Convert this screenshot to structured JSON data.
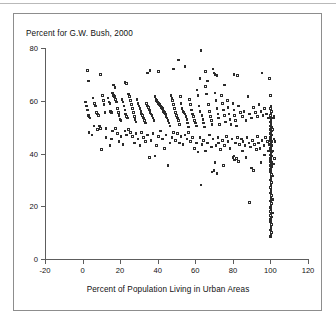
{
  "figure": {
    "title": "Percent for G.W. Bush, 2000",
    "xlabel": "Percent of Population Living in Urban Areas",
    "frame_color": "#8d8d8d",
    "axis_color": "#5d5d5d",
    "marker_color": "#2b2b2b",
    "background": "#ffffff"
  },
  "chart_data": {
    "type": "scatter",
    "title": "Percent for G.W. Bush, 2000",
    "xlabel": "Percent of Population Living in Urban Areas",
    "ylabel": "Percent for G.W. Bush, 2000",
    "xlim": [
      -20,
      120
    ],
    "ylim": [
      0,
      80
    ],
    "xticks": [
      -20,
      0,
      20,
      40,
      60,
      80,
      100,
      120
    ],
    "yticks": [
      0,
      20,
      40,
      60,
      80
    ],
    "grid": false,
    "legend": null,
    "marker": "open-square",
    "points": [
      [
        2.5,
        71.5
      ],
      [
        3.2,
        67.5
      ],
      [
        9.5,
        70.0
      ],
      [
        16.5,
        66.0
      ],
      [
        17.2,
        65.0
      ],
      [
        22.5,
        67.0
      ],
      [
        23.5,
        66.5
      ],
      [
        34.5,
        70.5
      ],
      [
        36.0,
        71.5
      ],
      [
        40.5,
        71.0
      ],
      [
        48.5,
        72.0
      ],
      [
        51.0,
        75.5
      ],
      [
        54.5,
        73.0
      ],
      [
        63.0,
        79.0
      ],
      [
        62.5,
        68.5
      ],
      [
        65.5,
        71.0
      ],
      [
        66.5,
        67.5
      ],
      [
        69.5,
        72.0
      ],
      [
        70.0,
        70.5
      ],
      [
        70.5,
        70.0
      ],
      [
        71.5,
        69.5
      ],
      [
        75.5,
        66.0
      ],
      [
        80.5,
        70.0
      ],
      [
        82.5,
        69.5
      ],
      [
        95.5,
        70.5
      ],
      [
        99.5,
        68.5
      ],
      [
        1.5,
        59.5
      ],
      [
        2.0,
        58.0
      ],
      [
        2.5,
        56.5
      ],
      [
        3.0,
        54.5
      ],
      [
        3.5,
        54.0
      ],
      [
        4.0,
        53.5
      ],
      [
        5.5,
        61.0
      ],
      [
        6.5,
        59.0
      ],
      [
        7.0,
        58.0
      ],
      [
        7.5,
        55.5
      ],
      [
        8.0,
        55.0
      ],
      [
        8.5,
        54.5
      ],
      [
        9.0,
        50.5
      ],
      [
        9.5,
        49.5
      ],
      [
        10.5,
        62.0
      ],
      [
        11.0,
        60.0
      ],
      [
        11.5,
        58.5
      ],
      [
        12.0,
        55.5
      ],
      [
        12.5,
        49.5
      ],
      [
        13.5,
        61.0
      ],
      [
        14.0,
        59.5
      ],
      [
        14.5,
        59.0
      ],
      [
        15.0,
        56.0
      ],
      [
        15.5,
        55.5
      ],
      [
        16.0,
        63.0
      ],
      [
        16.5,
        62.0
      ],
      [
        17.0,
        61.5
      ],
      [
        17.5,
        60.5
      ],
      [
        18.0,
        59.5
      ],
      [
        18.5,
        57.0
      ],
      [
        19.0,
        55.5
      ],
      [
        19.5,
        54.5
      ],
      [
        20.0,
        53.0
      ],
      [
        20.5,
        52.5
      ],
      [
        21.0,
        60.5
      ],
      [
        21.5,
        59.5
      ],
      [
        22.0,
        58.0
      ],
      [
        22.5,
        56.5
      ],
      [
        23.0,
        55.0
      ],
      [
        23.5,
        54.0
      ],
      [
        24.0,
        53.5
      ],
      [
        24.5,
        62.5
      ],
      [
        25.0,
        61.5
      ],
      [
        25.5,
        60.0
      ],
      [
        26.0,
        58.5
      ],
      [
        26.5,
        57.0
      ],
      [
        27.0,
        55.5
      ],
      [
        27.5,
        54.0
      ],
      [
        28.0,
        53.0
      ],
      [
        28.5,
        52.0
      ],
      [
        29.0,
        60.5
      ],
      [
        29.5,
        59.0
      ],
      [
        30.0,
        58.0
      ],
      [
        30.5,
        57.0
      ],
      [
        31.0,
        56.0
      ],
      [
        31.5,
        55.0
      ],
      [
        32.0,
        54.5
      ],
      [
        32.5,
        53.5
      ],
      [
        33.0,
        52.5
      ],
      [
        33.5,
        51.5
      ],
      [
        34.0,
        59.0
      ],
      [
        34.5,
        58.0
      ],
      [
        35.0,
        57.5
      ],
      [
        35.5,
        56.5
      ],
      [
        36.0,
        55.5
      ],
      [
        36.5,
        55.0
      ],
      [
        37.0,
        54.5
      ],
      [
        37.5,
        53.5
      ],
      [
        38.0,
        52.5
      ],
      [
        38.5,
        61.5
      ],
      [
        39.0,
        60.5
      ],
      [
        39.5,
        60.0
      ],
      [
        40.0,
        59.5
      ],
      [
        40.5,
        59.0
      ],
      [
        41.0,
        58.5
      ],
      [
        41.5,
        58.0
      ],
      [
        42.0,
        57.5
      ],
      [
        42.5,
        57.0
      ],
      [
        43.0,
        56.0
      ],
      [
        43.5,
        55.5
      ],
      [
        44.0,
        55.0
      ],
      [
        44.5,
        54.0
      ],
      [
        45.0,
        53.5
      ],
      [
        45.5,
        52.5
      ],
      [
        46.0,
        51.5
      ],
      [
        46.5,
        50.5
      ],
      [
        47.0,
        62.0
      ],
      [
        47.5,
        61.0
      ],
      [
        48.0,
        60.0
      ],
      [
        48.5,
        58.5
      ],
      [
        49.0,
        57.0
      ],
      [
        49.5,
        55.5
      ],
      [
        50.0,
        54.5
      ],
      [
        50.5,
        53.5
      ],
      [
        51.0,
        52.5
      ],
      [
        51.5,
        51.0
      ],
      [
        52.0,
        61.5
      ],
      [
        52.5,
        59.0
      ],
      [
        53.0,
        57.0
      ],
      [
        53.5,
        56.0
      ],
      [
        54.0,
        55.5
      ],
      [
        54.5,
        55.0
      ],
      [
        55.0,
        54.0
      ],
      [
        55.5,
        53.0
      ],
      [
        56.0,
        51.5
      ],
      [
        56.5,
        50.0
      ],
      [
        57.0,
        60.5
      ],
      [
        57.5,
        58.5
      ],
      [
        58.0,
        56.5
      ],
      [
        58.5,
        55.0
      ],
      [
        59.0,
        54.0
      ],
      [
        59.5,
        52.5
      ],
      [
        60.0,
        51.5
      ],
      [
        60.5,
        50.5
      ],
      [
        61.0,
        64.0
      ],
      [
        61.5,
        62.0
      ],
      [
        62.0,
        58.0
      ],
      [
        62.5,
        56.0
      ],
      [
        63.5,
        54.5
      ],
      [
        64.0,
        53.0
      ],
      [
        64.5,
        51.5
      ],
      [
        65.0,
        50.0
      ],
      [
        65.5,
        65.5
      ],
      [
        66.0,
        62.5
      ],
      [
        67.0,
        58.5
      ],
      [
        67.5,
        56.0
      ],
      [
        68.0,
        54.0
      ],
      [
        68.5,
        52.5
      ],
      [
        69.0,
        51.0
      ],
      [
        70.5,
        63.0
      ],
      [
        71.0,
        60.0
      ],
      [
        71.5,
        57.0
      ],
      [
        72.0,
        55.0
      ],
      [
        72.5,
        53.5
      ],
      [
        73.0,
        51.0
      ],
      [
        74.0,
        62.0
      ],
      [
        74.5,
        59.0
      ],
      [
        75.0,
        56.5
      ],
      [
        75.5,
        54.5
      ],
      [
        76.0,
        52.0
      ],
      [
        77.0,
        60.0
      ],
      [
        77.5,
        57.5
      ],
      [
        78.0,
        55.0
      ],
      [
        78.5,
        53.0
      ],
      [
        79.0,
        51.0
      ],
      [
        80.0,
        59.0
      ],
      [
        80.5,
        56.5
      ],
      [
        81.0,
        54.5
      ],
      [
        81.5,
        52.5
      ],
      [
        82.0,
        50.5
      ],
      [
        83.0,
        58.0
      ],
      [
        84.0,
        55.5
      ],
      [
        85.0,
        54.0
      ],
      [
        86.0,
        56.0
      ],
      [
        87.0,
        52.5
      ],
      [
        88.0,
        61.5
      ],
      [
        89.0,
        55.0
      ],
      [
        90.0,
        53.5
      ],
      [
        91.0,
        57.5
      ],
      [
        92.0,
        55.5
      ],
      [
        93.0,
        54.0
      ],
      [
        94.0,
        58.5
      ],
      [
        95.0,
        56.0
      ],
      [
        96.0,
        54.5
      ],
      [
        97.0,
        57.0
      ],
      [
        98.0,
        55.0
      ],
      [
        99.0,
        53.5
      ],
      [
        3.5,
        48.0
      ],
      [
        5.0,
        47.0
      ],
      [
        6.0,
        50.5
      ],
      [
        8.0,
        49.0
      ],
      [
        10.0,
        41.5
      ],
      [
        12.5,
        46.0
      ],
      [
        14.5,
        43.0
      ],
      [
        15.5,
        45.5
      ],
      [
        16.0,
        48.5
      ],
      [
        17.5,
        49.5
      ],
      [
        18.5,
        47.5
      ],
      [
        19.5,
        44.5
      ],
      [
        20.5,
        46.5
      ],
      [
        21.5,
        43.5
      ],
      [
        22.5,
        48.5
      ],
      [
        23.5,
        47.0
      ],
      [
        24.5,
        49.0
      ],
      [
        25.5,
        48.0
      ],
      [
        26.5,
        46.5
      ],
      [
        27.5,
        44.0
      ],
      [
        28.5,
        47.5
      ],
      [
        29.5,
        45.5
      ],
      [
        30.5,
        43.0
      ],
      [
        31.5,
        48.0
      ],
      [
        32.5,
        46.0
      ],
      [
        33.5,
        44.5
      ],
      [
        34.5,
        47.0
      ],
      [
        35.5,
        38.5
      ],
      [
        36.5,
        45.0
      ],
      [
        37.5,
        47.5
      ],
      [
        38.5,
        39.0
      ],
      [
        39.5,
        43.0
      ],
      [
        40.5,
        46.5
      ],
      [
        41.5,
        48.5
      ],
      [
        42.5,
        45.5
      ],
      [
        43.5,
        42.0
      ],
      [
        44.5,
        47.0
      ],
      [
        45.5,
        35.5
      ],
      [
        46.5,
        44.0
      ],
      [
        47.5,
        46.0
      ],
      [
        48.5,
        48.0
      ],
      [
        49.5,
        45.0
      ],
      [
        50.5,
        47.5
      ],
      [
        51.5,
        44.0
      ],
      [
        52.5,
        46.5
      ],
      [
        53.5,
        43.5
      ],
      [
        54.5,
        47.0
      ],
      [
        55.5,
        45.5
      ],
      [
        56.5,
        48.0
      ],
      [
        57.5,
        44.5
      ],
      [
        58.5,
        46.0
      ],
      [
        59.5,
        42.0
      ],
      [
        60.5,
        44.0
      ],
      [
        61.5,
        40.5
      ],
      [
        62.5,
        46.0
      ],
      [
        63.0,
        28.0
      ],
      [
        63.5,
        43.5
      ],
      [
        64.5,
        45.0
      ],
      [
        65.5,
        41.0
      ],
      [
        66.5,
        44.0
      ],
      [
        67.5,
        47.0
      ],
      [
        68.5,
        42.5
      ],
      [
        69.0,
        33.0
      ],
      [
        69.5,
        45.5
      ],
      [
        70.0,
        33.5
      ],
      [
        70.5,
        36.5
      ],
      [
        71.0,
        43.0
      ],
      [
        71.5,
        32.5
      ],
      [
        72.0,
        46.0
      ],
      [
        72.5,
        44.0
      ],
      [
        73.5,
        41.5
      ],
      [
        74.5,
        45.0
      ],
      [
        75.0,
        35.5
      ],
      [
        75.5,
        43.0
      ],
      [
        76.5,
        46.5
      ],
      [
        77.5,
        44.5
      ],
      [
        78.5,
        42.0
      ],
      [
        79.5,
        45.5
      ],
      [
        80.0,
        38.5
      ],
      [
        80.5,
        39.0
      ],
      [
        81.0,
        37.5
      ],
      [
        81.5,
        44.0
      ],
      [
        82.0,
        38.0
      ],
      [
        82.5,
        46.0
      ],
      [
        83.0,
        37.0
      ],
      [
        83.5,
        43.5
      ],
      [
        84.5,
        45.5
      ],
      [
        85.0,
        41.0
      ],
      [
        85.5,
        44.5
      ],
      [
        86.5,
        43.0
      ],
      [
        87.0,
        38.5
      ],
      [
        87.5,
        46.0
      ],
      [
        88.5,
        44.0
      ],
      [
        89.0,
        21.5
      ],
      [
        89.5,
        42.5
      ],
      [
        90.0,
        34.5
      ],
      [
        90.5,
        45.0
      ],
      [
        91.0,
        33.5
      ],
      [
        91.5,
        43.5
      ],
      [
        92.5,
        41.5
      ],
      [
        93.0,
        46.5
      ],
      [
        93.5,
        44.0
      ],
      [
        94.5,
        42.0
      ],
      [
        95.0,
        36.5
      ],
      [
        95.5,
        45.0
      ],
      [
        96.5,
        43.0
      ],
      [
        97.0,
        39.5
      ],
      [
        97.5,
        46.0
      ],
      [
        98.5,
        44.5
      ],
      [
        99.0,
        41.0
      ],
      [
        99.5,
        43.5
      ],
      [
        100.0,
        62.0
      ],
      [
        100.2,
        58.0
      ],
      [
        100.0,
        57.0
      ],
      [
        100.5,
        56.0
      ],
      [
        100.2,
        55.0
      ],
      [
        100.0,
        54.5
      ],
      [
        100.6,
        53.5
      ],
      [
        100.3,
        53.0
      ],
      [
        100.0,
        52.0
      ],
      [
        100.4,
        51.0
      ],
      [
        100.1,
        50.5
      ],
      [
        100.5,
        50.0
      ],
      [
        100.2,
        49.5
      ],
      [
        100.0,
        49.0
      ],
      [
        100.6,
        48.5
      ],
      [
        100.3,
        48.0
      ],
      [
        100.1,
        47.5
      ],
      [
        100.5,
        47.0
      ],
      [
        100.2,
        46.5
      ],
      [
        100.0,
        46.0
      ],
      [
        100.4,
        45.5
      ],
      [
        100.1,
        45.0
      ],
      [
        100.6,
        44.5
      ],
      [
        100.3,
        44.0
      ],
      [
        100.0,
        43.5
      ],
      [
        100.5,
        43.0
      ],
      [
        100.2,
        42.5
      ],
      [
        100.0,
        42.0
      ],
      [
        100.4,
        41.5
      ],
      [
        100.1,
        41.0
      ],
      [
        100.6,
        40.5
      ],
      [
        100.3,
        40.0
      ],
      [
        100.0,
        39.5
      ],
      [
        100.5,
        39.0
      ],
      [
        100.2,
        38.5
      ],
      [
        100.0,
        38.0
      ],
      [
        100.4,
        37.5
      ],
      [
        100.1,
        37.0
      ],
      [
        100.6,
        36.5
      ],
      [
        100.3,
        36.0
      ],
      [
        100.0,
        35.5
      ],
      [
        100.5,
        35.0
      ],
      [
        100.2,
        34.5
      ],
      [
        100.0,
        34.0
      ],
      [
        100.4,
        33.5
      ],
      [
        100.1,
        33.0
      ],
      [
        100.6,
        32.0
      ],
      [
        100.3,
        31.0
      ],
      [
        100.0,
        30.0
      ],
      [
        100.5,
        29.0
      ],
      [
        100.2,
        28.0
      ],
      [
        100.0,
        27.0
      ],
      [
        100.4,
        26.0
      ],
      [
        100.1,
        25.0
      ],
      [
        100.6,
        24.0
      ],
      [
        100.3,
        23.0
      ],
      [
        100.0,
        22.0
      ],
      [
        100.5,
        21.0
      ],
      [
        100.2,
        20.0
      ],
      [
        100.0,
        19.5
      ],
      [
        100.4,
        19.0
      ],
      [
        100.1,
        18.0
      ],
      [
        100.6,
        17.5
      ],
      [
        100.3,
        17.0
      ],
      [
        100.0,
        16.5
      ],
      [
        100.5,
        16.0
      ],
      [
        100.2,
        15.5
      ],
      [
        100.0,
        15.0
      ],
      [
        100.4,
        14.5
      ],
      [
        100.1,
        14.0
      ],
      [
        100.6,
        13.0
      ],
      [
        100.3,
        12.0
      ],
      [
        100.0,
        11.0
      ],
      [
        100.5,
        10.0
      ],
      [
        100.2,
        9.0
      ],
      [
        100.0,
        8.5
      ],
      [
        101.5,
        53.5
      ],
      [
        101.0,
        49.0
      ],
      [
        101.8,
        45.5
      ],
      [
        101.2,
        41.0
      ],
      [
        101.6,
        36.0
      ],
      [
        101.0,
        31.5
      ],
      [
        101.4,
        22.5
      ],
      [
        101.1,
        17.5
      ],
      [
        102.0,
        54.0
      ],
      [
        102.5,
        44.5
      ],
      [
        102.2,
        38.0
      ]
    ]
  },
  "axes": {
    "x_tick_labels": [
      "-20",
      "0",
      "20",
      "40",
      "60",
      "80",
      "100",
      "120"
    ],
    "y_tick_labels": [
      "0",
      "20",
      "40",
      "60",
      "80"
    ]
  }
}
